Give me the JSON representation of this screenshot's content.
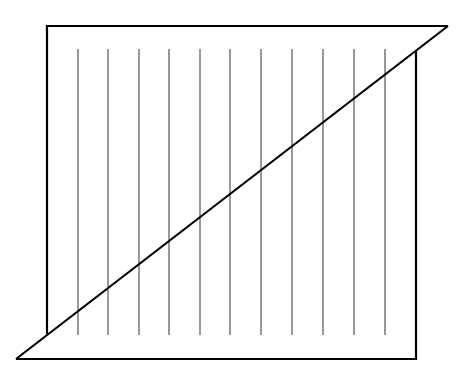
{
  "diagram": {
    "stroke_color": "#000000",
    "thin_stroke_color": "#333333",
    "background": "#ffffff",
    "outline_upper": {
      "points": [
        [
          47,
          334
        ],
        [
          47,
          26
        ],
        [
          448,
          26
        ],
        [
          16,
          359
        ]
      ]
    },
    "outline_lower": {
      "points": [
        [
          416,
          50
        ],
        [
          416,
          359
        ],
        [
          16,
          359
        ]
      ]
    },
    "diagonal": {
      "x1": 448,
      "y1": 26,
      "x2": 16,
      "y2": 359
    },
    "vertical_lines": {
      "xs": [
        78,
        108,
        139,
        169,
        200,
        230,
        261,
        292,
        323,
        354,
        385
      ],
      "y_top": 49,
      "y_bottom": 335
    }
  }
}
